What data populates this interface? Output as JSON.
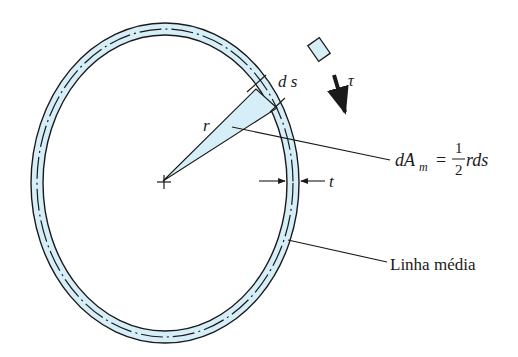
{
  "diagram": {
    "colors": {
      "ring_fill": "#d6eef7",
      "stroke": "#1a1a1a",
      "element_fill": "#d6eef7"
    },
    "labels": {
      "ds": "d s",
      "r": "r",
      "tau": "τ",
      "t": "t",
      "area_lhs": "dA",
      "area_sub": "m",
      "area_eq": "=",
      "area_num": "1",
      "area_den": "2",
      "area_rhs": "rds",
      "median_line": "Linha média"
    }
  }
}
